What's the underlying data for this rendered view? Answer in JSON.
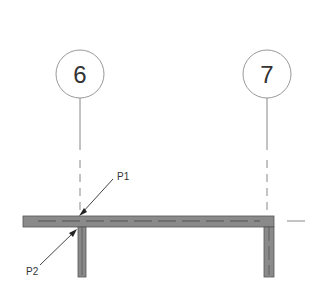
{
  "grid": {
    "bubbles": [
      {
        "label": "6",
        "cx": 80,
        "cy": 74,
        "r": 24
      },
      {
        "label": "7",
        "cx": 267,
        "cy": 74,
        "r": 24
      }
    ]
  },
  "annotations": [
    {
      "label": "P1",
      "text_x": 117,
      "text_y": 179
    },
    {
      "label": "P2",
      "text_x": 26,
      "text_y": 274
    }
  ],
  "colors": {
    "wall_fill": "#8a8a8a",
    "wall_edge": "#555555",
    "line": "#666666",
    "bubble_stroke": "#999999",
    "text": "#333333"
  }
}
